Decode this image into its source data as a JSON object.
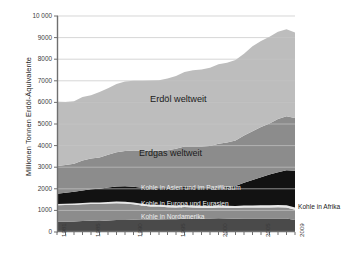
{
  "chart_data": {
    "type": "area",
    "stacked": true,
    "title": "",
    "xlabel": "",
    "ylabel": "Millionen Tonnen Erdöl-Äquivalente",
    "ylim": [
      0,
      10000
    ],
    "xlim": [
      1981,
      2009
    ],
    "grid": true,
    "grid_axis": "y",
    "legend": "in-plot annotations",
    "ytick_labels": [
      "10 000",
      "9000",
      "8000",
      "7000",
      "6000",
      "5000",
      "4000",
      "3000",
      "2000",
      "1000",
      "0"
    ],
    "ytick_values": [
      10000,
      9000,
      8000,
      7000,
      6000,
      5000,
      4000,
      3000,
      2000,
      1000,
      0
    ],
    "xtick_labels": [
      "1981",
      "1985",
      "1990",
      "1995",
      "2000",
      "2005",
      "2009"
    ],
    "xtick_values": [
      1981,
      1985,
      1990,
      1995,
      2000,
      2005,
      2009
    ],
    "x": [
      1981,
      1982,
      1983,
      1984,
      1985,
      1986,
      1987,
      1988,
      1989,
      1990,
      1991,
      1992,
      1993,
      1994,
      1995,
      1996,
      1997,
      1998,
      1999,
      2000,
      2001,
      2002,
      2003,
      2004,
      2005,
      2006,
      2007,
      2008,
      2009
    ],
    "stack_order_bottom_to_top": [
      "Kohle in Nordamerika",
      "Kohle in Europa und Eurasien",
      "Kohle in Afrika",
      "Kohle in Asien und im Pazifikraum",
      "Erdgas weltweit",
      "Erdöl weltweit"
    ],
    "series": [
      {
        "name": "Kohle in Nordamerika",
        "color": "#4a4a4a",
        "label_color": "#ededed",
        "values": [
          480,
          480,
          485,
          510,
          520,
          515,
          535,
          555,
          560,
          565,
          560,
          565,
          580,
          585,
          595,
          615,
          620,
          620,
          620,
          635,
          620,
          615,
          625,
          625,
          630,
          625,
          630,
          625,
          560
        ]
      },
      {
        "name": "Kohle in Europa und Eurasien",
        "color": "#8c8c8c",
        "label_color": "#f3f3f3",
        "values": [
          760,
          765,
          770,
          775,
          780,
          780,
          785,
          780,
          760,
          720,
          665,
          620,
          595,
          565,
          545,
          540,
          520,
          505,
          495,
          500,
          500,
          495,
          505,
          505,
          505,
          510,
          515,
          510,
          475
        ]
      },
      {
        "name": "Kohle in Afrika",
        "color": "#e8e8e8",
        "label_color": "#1b1b1b",
        "values": [
          55,
          58,
          60,
          62,
          65,
          68,
          70,
          72,
          75,
          76,
          78,
          80,
          82,
          84,
          86,
          88,
          90,
          92,
          92,
          94,
          95,
          96,
          98,
          100,
          102,
          103,
          105,
          106,
          105
        ]
      },
      {
        "name": "Kohle in Asien und im Pazifikraum",
        "color": "#121212",
        "label_color": "#ededed",
        "values": [
          480,
          510,
          545,
          580,
          615,
          635,
          665,
          700,
          720,
          735,
          745,
          760,
          775,
          800,
          830,
          840,
          845,
          830,
          820,
          825,
          865,
          925,
          1055,
          1180,
          1300,
          1420,
          1520,
          1620,
          1700
        ]
      },
      {
        "name": "Erdgas weltweit",
        "color": "#8c8c8c",
        "label_color": "#1b1b1b",
        "values": [
          1280,
          1285,
          1300,
          1380,
          1420,
          1450,
          1520,
          1580,
          1640,
          1680,
          1710,
          1720,
          1740,
          1750,
          1800,
          1880,
          1880,
          1910,
          1950,
          2030,
          2060,
          2110,
          2180,
          2250,
          2320,
          2370,
          2460,
          2500,
          2440
        ]
      },
      {
        "name": "Erdöl weltweit",
        "color": "#bdbdbd",
        "label_color": "#1b1b1b",
        "values": [
          2970,
          2920,
          2890,
          2940,
          2930,
          3030,
          3080,
          3170,
          3210,
          3230,
          3240,
          3270,
          3250,
          3320,
          3370,
          3440,
          3530,
          3570,
          3630,
          3680,
          3700,
          3720,
          3790,
          3940,
          3990,
          4010,
          4040,
          4030,
          3960
        ]
      }
    ]
  },
  "annotations": {
    "erdoel": "Erdöl weltweit",
    "erdgas": "Erdgas weltweit",
    "kohle_asien": "Kohle in Asien und im Pazifikraum",
    "kohle_europa": "Kohle in Europa und Eurasien",
    "kohle_nordamerika": "Kohle in Nordamerika",
    "kohle_afrika": "Kohle in Afrika"
  },
  "caption": {
    "text": ""
  },
  "colors": {
    "axis": "#6f6f6f",
    "grid": "#c4c4c4",
    "tick_text": "#3a3a3a",
    "background": "#ffffff"
  }
}
